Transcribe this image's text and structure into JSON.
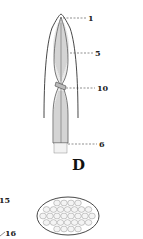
{
  "figure": {
    "panel_label": "D",
    "labels": [
      "1",
      "5",
      "10",
      "6",
      "15",
      "16"
    ]
  },
  "colors": {
    "ink": "#333333",
    "background": "#ffffff"
  }
}
